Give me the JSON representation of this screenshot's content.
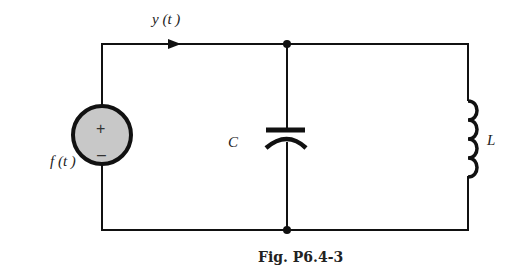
{
  "figure": {
    "caption": "Fig. P6.4-3",
    "type": "circuit-diagram"
  },
  "labels": {
    "current": "y (t )",
    "source": "f (t )",
    "capacitor": "C",
    "inductor": "L"
  },
  "source": {
    "plus": "+",
    "minus": "–",
    "fill_color": "#c8c8c8"
  },
  "components": [
    {
      "id": "source",
      "kind": "voltage-source",
      "label": "f(t)"
    },
    {
      "id": "capacitor",
      "kind": "capacitor",
      "label": "C"
    },
    {
      "id": "inductor",
      "kind": "inductor",
      "label": "L"
    }
  ],
  "colors": {
    "wire": "#111111",
    "background": "#ffffff"
  }
}
